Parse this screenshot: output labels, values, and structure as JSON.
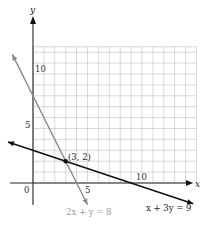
{
  "chart_data": {
    "type": "line",
    "title": "",
    "xlabel": "x",
    "ylabel": "y",
    "xlim": [
      -3,
      15
    ],
    "ylim": [
      -2,
      14
    ],
    "grid": true,
    "grid_x_range": [
      0,
      15
    ],
    "grid_y_range": [
      0,
      12.5
    ],
    "x_ticks_labeled": [
      {
        "value": 0,
        "label": "0"
      },
      {
        "value": 5,
        "label": "5"
      },
      {
        "value": 10,
        "label": "10"
      }
    ],
    "y_ticks_labeled": [
      {
        "value": 5,
        "label": "5"
      },
      {
        "value": 10,
        "label": "10"
      }
    ],
    "series": [
      {
        "name": "2x + y = 8",
        "equation": "2x + y = 8",
        "color": "#8a8a8a",
        "points": [
          [
            -1.9,
            11.8
          ],
          [
            0,
            8
          ],
          [
            3,
            2
          ],
          [
            4,
            0
          ],
          [
            5,
            -2
          ]
        ]
      },
      {
        "name": "x + 3y = 9",
        "equation": "x + 3y = 9",
        "color": "#111111",
        "points": [
          [
            -2.3,
            3.77
          ],
          [
            0,
            3
          ],
          [
            3,
            2
          ],
          [
            9,
            0
          ],
          [
            14.7,
            -1.9
          ]
        ]
      }
    ],
    "annotations": [
      {
        "text": "(3, 2)",
        "x": 3,
        "y": 2,
        "type": "intersection-point"
      }
    ],
    "legend": "inline equation labels below lines"
  },
  "labels": {
    "x_axis": "x",
    "y_axis": "y",
    "origin": "0",
    "x5": "5",
    "x10": "10",
    "y5": "5",
    "y10": "10",
    "point": "(3, 2)",
    "eq1": "2x + y = 8",
    "eq2": "x + 3y = 9"
  }
}
